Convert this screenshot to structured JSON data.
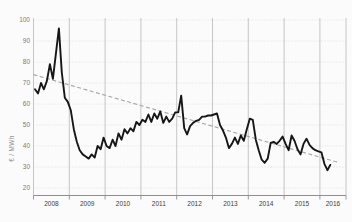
{
  "window": {
    "width_px": 352,
    "height_px": 222
  },
  "chart_data": {
    "type": "line",
    "title": "",
    "xlabel": "",
    "ylabel": "€ / MWh",
    "ylim": [
      20,
      100
    ],
    "y_ticks": [
      100,
      90,
      80,
      70,
      60,
      50,
      40,
      30,
      20
    ],
    "x_year_labels": [
      "2008",
      "2009",
      "2010",
      "2011",
      "2012",
      "2013",
      "2014",
      "2015",
      "2016"
    ],
    "grid": {
      "horizontal_style": "dotted",
      "vertical_style": "solid",
      "legend": "none"
    },
    "start_month": "2008-01",
    "end_month": "2016-04",
    "series": [
      {
        "name": "monthly_price",
        "style": "solid",
        "color": "#161616",
        "values": [
          67,
          65,
          70,
          67,
          71,
          79,
          72,
          84,
          96,
          75,
          63,
          61,
          57,
          48,
          42,
          38,
          36,
          35,
          34,
          36,
          34.5,
          40,
          38.5,
          44,
          40,
          39,
          43,
          40,
          46,
          43,
          48,
          46,
          48.5,
          47,
          51.5,
          50,
          52.5,
          51.5,
          55,
          51.5,
          55.5,
          53,
          56.5,
          51,
          54,
          51.5,
          53,
          56,
          56,
          64,
          48.5,
          45.5,
          49.5,
          51,
          52,
          52.5,
          54,
          54,
          54.5,
          54.5,
          55,
          55.5,
          50,
          47.5,
          44,
          39,
          41,
          44,
          41,
          45,
          42.5,
          48,
          53,
          52.5,
          43,
          38,
          33.5,
          32,
          34,
          41.5,
          42,
          41,
          42.5,
          44.5,
          41,
          38,
          45,
          42.5,
          38.5,
          36,
          41,
          43.5,
          40.5,
          39,
          38,
          37.5,
          37,
          31.5,
          28.5,
          31
        ]
      },
      {
        "name": "linear_trend",
        "style": "dashed",
        "color": "#a6a6a6",
        "from": {
          "year_frac": 2008.0,
          "value": 74
        },
        "to": {
          "year_frac": 2016.55,
          "value": 32
        }
      }
    ]
  }
}
